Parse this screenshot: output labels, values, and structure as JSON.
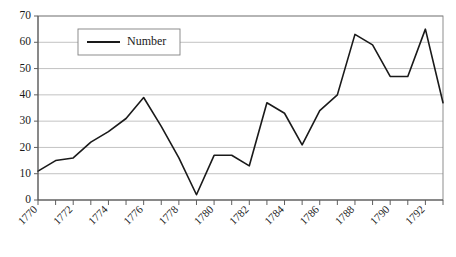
{
  "chart_data": {
    "type": "line",
    "title": "",
    "xlabel": "",
    "ylabel": "",
    "grid": true,
    "legend_position": "top-left-inside",
    "ylim": [
      0,
      70
    ],
    "ytick_labels": [
      "0",
      "10",
      "20",
      "30",
      "40",
      "50",
      "60",
      "70"
    ],
    "yticks": [
      0,
      10,
      20,
      30,
      40,
      50,
      60,
      70
    ],
    "xlim": [
      1770,
      1793
    ],
    "xtick_labels": [
      "1770",
      "1772",
      "1774",
      "1776",
      "1778",
      "1780",
      "1782",
      "1784",
      "1786",
      "1788",
      "1790",
      "1792"
    ],
    "xticks_major": [
      1770,
      1772,
      1774,
      1776,
      1778,
      1780,
      1782,
      1784,
      1786,
      1788,
      1790,
      1792
    ],
    "x": [
      1770,
      1771,
      1772,
      1773,
      1774,
      1775,
      1776,
      1777,
      1778,
      1779,
      1780,
      1781,
      1782,
      1783,
      1784,
      1785,
      1786,
      1787,
      1788,
      1789,
      1790,
      1791,
      1792,
      1793
    ],
    "series": [
      {
        "name": "Number",
        "color": "#1a1a1a",
        "values": [
          11,
          15,
          16,
          22,
          26,
          31,
          39,
          28,
          16,
          2,
          17,
          17,
          13,
          37,
          33,
          21,
          34,
          40,
          63,
          59,
          47,
          47,
          65,
          37
        ]
      }
    ],
    "legend": [
      "Number"
    ],
    "colors": {
      "line": "#1a1a1a",
      "grid": "#b3b3b3",
      "axis": "#4d4d4d",
      "background": "#ffffff"
    }
  }
}
